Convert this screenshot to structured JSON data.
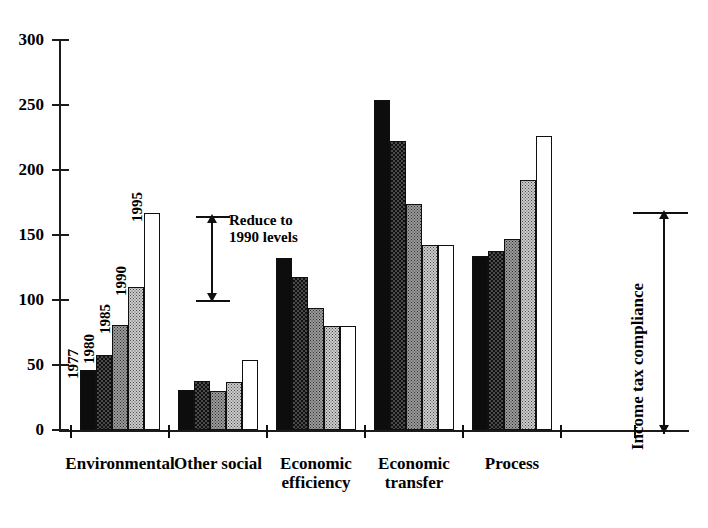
{
  "chart_data": {
    "type": "bar",
    "title": "",
    "xlabel": "",
    "ylabel": "",
    "ylim": [
      0,
      300
    ],
    "ytick_step": 50,
    "yticks": [
      "300",
      "250",
      "200",
      "150",
      "100",
      "50",
      "0"
    ],
    "grid": false,
    "legend_position": "none",
    "categories": [
      "Environmental",
      "Other social",
      "Economic\nefficiency",
      "Economic\ntransfer",
      "Process"
    ],
    "series": [
      {
        "name": "1977",
        "values": [
          46,
          31,
          132,
          254,
          134
        ]
      },
      {
        "name": "1980",
        "values": [
          58,
          38,
          118,
          222,
          138
        ]
      },
      {
        "name": "1985",
        "values": [
          81,
          30,
          94,
          174,
          147
        ]
      },
      {
        "name": "1990",
        "values": [
          110,
          37,
          80,
          142,
          192
        ]
      },
      {
        "name": "1995",
        "values": [
          167,
          54,
          80,
          142,
          226
        ]
      }
    ],
    "series_year_labels_shown_on_group": 1,
    "annotations": [
      {
        "name": "reduce-to-1990-levels",
        "text": "Reduce to\n1990 levels",
        "from_value": 167,
        "to_value": 100
      },
      {
        "name": "income-tax-compliance",
        "text": "Income tax compliance",
        "from_value": 172,
        "to_value": 0
      }
    ]
  },
  "axis": {
    "y_labels": [
      "300",
      "250",
      "200",
      "150",
      "100",
      "50",
      "0"
    ]
  },
  "groups": [
    {
      "label": "Environmental"
    },
    {
      "label": "Other social"
    },
    {
      "label": "Economic\nefficiency"
    },
    {
      "label": "Economic\ntransfer"
    },
    {
      "label": "Process"
    }
  ],
  "year_labels": [
    "1977",
    "1980",
    "1985",
    "1990",
    "1995"
  ],
  "annotations": {
    "reduce": "Reduce to\n1990 levels",
    "income_tax": "Income tax compliance"
  },
  "colors": {
    "ink": "#101010",
    "series_1977": "#0d0d0d",
    "series_1980": "#4a4a4a",
    "series_1985": "#9b9b9b",
    "series_1990": "#cccccc",
    "series_1995": "#ffffff"
  }
}
